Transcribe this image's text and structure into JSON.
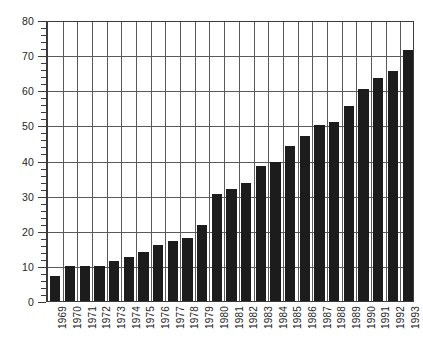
{
  "chart_data": {
    "type": "bar",
    "title": "",
    "subtitle": "",
    "xlabel": "",
    "ylabel": "",
    "categories": [
      "1969",
      "1970",
      "1971",
      "1972",
      "1973",
      "1974",
      "1975",
      "1976",
      "1977",
      "1978",
      "1979",
      "1980",
      "1981",
      "1982",
      "1983",
      "1984",
      "1985",
      "1986",
      "1987",
      "1988",
      "1989",
      "1990",
      "1991",
      "1992",
      "1993"
    ],
    "values": [
      7,
      10,
      10,
      10,
      11.5,
      12.5,
      14,
      16,
      17,
      18,
      21.5,
      30.5,
      32,
      33.5,
      38.5,
      39.5,
      44,
      47,
      50,
      51,
      55.5,
      60.5,
      63.5,
      65.5,
      71.5
    ],
    "series": [
      {
        "name": "value",
        "values": [
          7,
          10,
          10,
          10,
          11.5,
          12.5,
          14,
          16,
          17,
          18,
          21.5,
          30.5,
          32,
          33.5,
          38.5,
          39.5,
          44,
          47,
          50,
          51,
          55.5,
          60.5,
          63.5,
          65.5,
          71.5
        ]
      }
    ],
    "ylim": [
      0,
      80
    ],
    "ytick_labels": [
      "0",
      "10",
      "20",
      "30",
      "40",
      "50",
      "60",
      "70",
      "80"
    ],
    "ytick_values": [
      0,
      10,
      20,
      30,
      40,
      50,
      60,
      70,
      80
    ],
    "yminor_step": 2,
    "grid": "both",
    "legend": "none",
    "bar_color": "#1c1c1c",
    "grid_color": "#5a5a5a",
    "axis_color": "#3b3b3b",
    "background_color": "#ffffff",
    "xtick_label_rotation": -90
  }
}
